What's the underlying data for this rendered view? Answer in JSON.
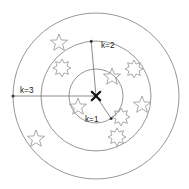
{
  "figure": {
    "background_color": "#ffffff",
    "ring_color": "#8a8a8a",
    "marker_color": "#9a9a9a",
    "center_marker_color": "#111111",
    "label_color": "#1a1a1a"
  },
  "labels": {
    "k1": "k=1",
    "k2": "k=2",
    "k3": "k=3"
  },
  "chart_data": {
    "type": "scatter",
    "xlabel": "",
    "ylabel": "",
    "center": {
      "x": 96,
      "y": 96,
      "marker": "x"
    },
    "rings": [
      {
        "label": "k=1",
        "radius": 27
      },
      {
        "label": "k=2",
        "radius": 55
      },
      {
        "label": "k=3",
        "radius": 83
      }
    ],
    "radius_arrows": [
      {
        "label": "k=1",
        "angle_deg": 56,
        "radius": 27,
        "label_x": 85,
        "label_y": 122
      },
      {
        "label": "k=2",
        "angle_deg": 265,
        "radius": 55,
        "label_x": 101,
        "label_y": 48
      },
      {
        "label": "k=3",
        "angle_deg": 180,
        "radius": 83,
        "label_x": 20,
        "label_y": 93
      }
    ],
    "series": [
      {
        "name": "class-a-star",
        "marker": "five-point-star",
        "points": [
          {
            "x": 59,
            "y": 43
          },
          {
            "x": 112,
            "y": 77
          },
          {
            "x": 78,
            "y": 107
          },
          {
            "x": 142,
            "y": 105
          },
          {
            "x": 36,
            "y": 139
          }
        ]
      },
      {
        "name": "class-b-burst",
        "marker": "burst-star",
        "points": [
          {
            "x": 62,
            "y": 68
          },
          {
            "x": 134,
            "y": 69
          },
          {
            "x": 121,
            "y": 117
          },
          {
            "x": 117,
            "y": 137
          }
        ]
      }
    ],
    "grid": false,
    "legend": "none"
  }
}
